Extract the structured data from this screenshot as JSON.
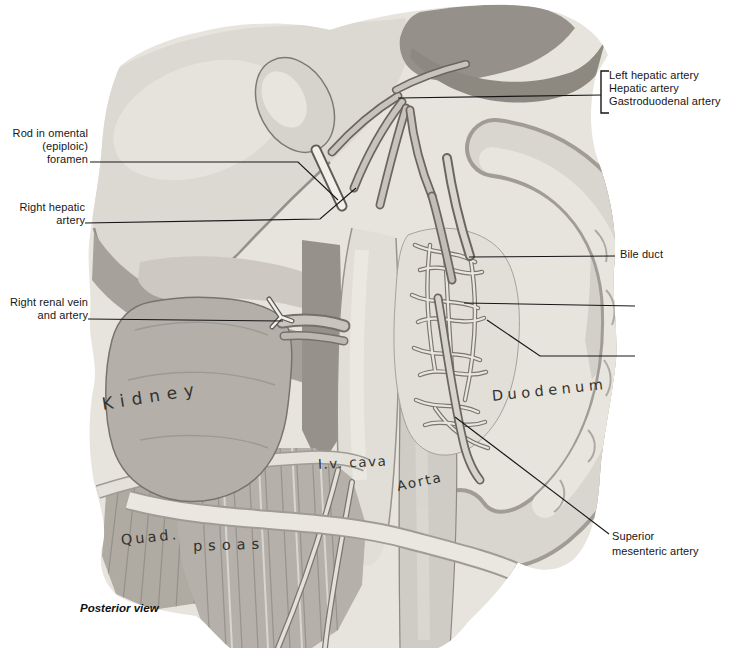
{
  "palette": {
    "background": "#ffffff",
    "ink": "#161616",
    "wash_light": "#e7e4de",
    "wash_mid": "#b5b1aa",
    "wash_dark": "#8d8981"
  },
  "caption": "Posterior view",
  "annotations": {
    "left_hepatic_artery": "Left hepatic artery",
    "hepatic_artery": "Hepatic artery",
    "gastroduodenal_artery": "Gastroduodenal artery",
    "rod_in_omental_foramen": "Rod in omental\n(epiploic)\nforamen",
    "right_hepatic_artery": "Right hepatic\nartery",
    "right_renal_vein_artery": "Right renal vein\nand artery",
    "bile_duct": "Bile duct",
    "head_of_pancreas": "Head of pancreas,\nposterior surface",
    "posterior_pancreaticoduodenal_arch": "Posterior\npancreatico-\nduodenal\narch",
    "superior_mesenteric_artery": "Superior\nmesenteric artery"
  },
  "structures": {
    "kidney": "Kidney",
    "duodenum": "Duodenum",
    "ivc": "I.v. cava",
    "aorta": "Aorta",
    "quad": "Quad.",
    "psoas": "psoas"
  }
}
